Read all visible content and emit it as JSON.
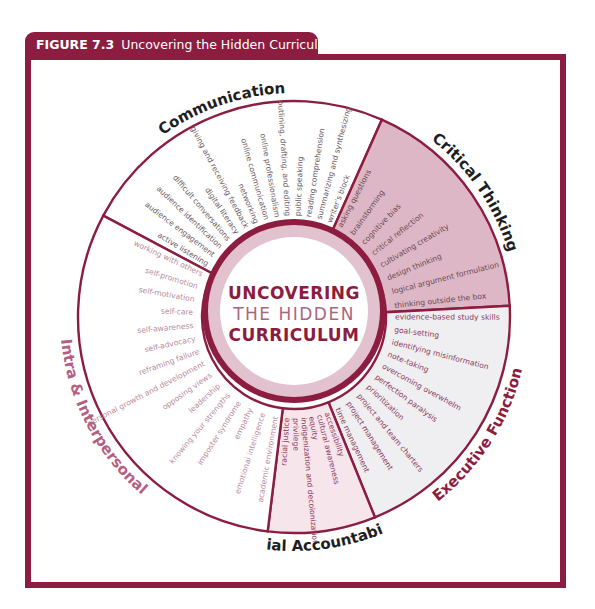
{
  "figure": {
    "label": "FIGURE 7.3",
    "title": "Uncovering the Hidden Curriculum"
  },
  "center": {
    "line1": "UNCOVERING",
    "line2": "THE HIDDEN",
    "line3": "CURRICULUM"
  },
  "colors": {
    "accent": "#8c1d40",
    "ring_band": "#e2c2cf",
    "critical_fill": "#ddb7c5",
    "social_fill": "#f7e5ec",
    "executive_fill": "#efeff1",
    "white_fill": "#ffffff",
    "item_dark": "#6a5a62",
    "item_pink": "#b98ba0",
    "item_crimson": "#8c1d40",
    "label_dark": "#1e1e1e",
    "label_pink": "#b45f82"
  },
  "geometry": {
    "cx": 294,
    "cy": 317,
    "outer_r": 216,
    "inner_r": 92,
    "band_r": 86,
    "white_r": 74
  },
  "categories": [
    {
      "name": "Communication",
      "start_angle": 208,
      "end_angle": 294,
      "fill": "#ffffff",
      "item_color": "#6a5a62",
      "label_color": "#1e1e1e",
      "items": [
        "active listening",
        "audience engagement",
        "audience identification",
        "difficult conversations",
        "digital literacy",
        "giving and receiving feedback",
        "networking",
        "online communication",
        "online professionalism",
        "outlining, drafting, and editing",
        "public speaking",
        "reading comprehension",
        "summarizing and synthesizing",
        "writer's block"
      ]
    },
    {
      "name": "Critical Thinking",
      "start_angle": 294,
      "end_angle": 357,
      "fill": "#ddb7c5",
      "item_color": "#6a4a56",
      "label_color": "#1e1e1e",
      "items": [
        "asking questions",
        "brainstorming",
        "cognitive bias",
        "critical reflection",
        "cultivating creativity",
        "design thinking",
        "logical argument formulation",
        "thinking outside the box"
      ]
    },
    {
      "name": "Executive Function",
      "start_angle": 357,
      "end_angle": 428,
      "fill": "#efeff1",
      "item_color": "#8c3a5a",
      "label_color": "#8c1d40",
      "items": [
        "evidence-based study skills",
        "goal-setting",
        "identifying misinformation",
        "note-taking",
        "overcoming overwhelm",
        "perfection paralysis",
        "prioritization",
        "project and team charters",
        "project management",
        "time management"
      ]
    },
    {
      "name": "Social Accountability",
      "start_angle": 428,
      "end_angle": 457,
      "fill": "#f7e5ec",
      "item_color": "#8c3a5a",
      "label_color": "#1e1e1e",
      "items": [
        "accessibility",
        "cultural awareness",
        "equity",
        "indigenization and decolonization",
        "privilege",
        "racial justice"
      ]
    },
    {
      "name": "Intra & Interpersonal",
      "start_angle": 457,
      "end_angle": 568,
      "fill": "#ffffff",
      "item_color": "#b98ba0",
      "label_color": "#b45f82",
      "items": [
        "academic environment",
        "emotional intelligence",
        "empathy",
        "imposter syndrome",
        "knowing your strengths",
        "leadership",
        "opposing views",
        "personal growth and development",
        "reframing failure",
        "self-advocacy",
        "self-awareness",
        "self-care",
        "self-motivation",
        "self-promotion",
        "working with others"
      ]
    }
  ]
}
